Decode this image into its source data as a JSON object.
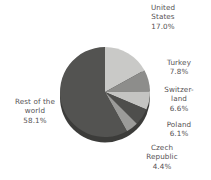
{
  "chart_data": {
    "type": "pie",
    "title": "",
    "subtitle": "",
    "xlabel": "",
    "ylabel": "",
    "legend_position": "none",
    "grid": false,
    "label_format": "name + percent",
    "start_angle_deg": 0,
    "direction": "clockwise",
    "categories": [
      "United States",
      "Turkey",
      "Switzerland",
      "Poland",
      "Czech Republic",
      "Rest of the world"
    ],
    "values": [
      17.0,
      7.8,
      6.6,
      6.1,
      4.4,
      58.1
    ],
    "units": "%",
    "slices": [
      {
        "name": "United States",
        "label_lines": "United\nStates\n17.0%",
        "value": 17.0,
        "percent_text": "17.0%",
        "color": "#c9c9c7"
      },
      {
        "name": "Turkey",
        "label_lines": "Turkey\n7.8%",
        "value": 7.8,
        "percent_text": "7.8%",
        "color": "#8d8d8b"
      },
      {
        "name": "Switzerland",
        "label_lines": "Switzer-\nland\n6.6%",
        "value": 6.6,
        "percent_text": "6.6%",
        "color": "#c4c4c2"
      },
      {
        "name": "Poland",
        "label_lines": "Poland\n6.1%",
        "value": 6.1,
        "percent_text": "6.1%",
        "color": "#4e4e4c"
      },
      {
        "name": "Czech Republic",
        "label_lines": "Czech\nRepublic\n4.4%",
        "value": 4.4,
        "percent_text": "4.4%",
        "color": "#9b9b99"
      },
      {
        "name": "Rest of the world",
        "label_lines": "Rest of the\nworld\n58.1%",
        "value": 58.1,
        "percent_text": "58.1%",
        "color": "#535351"
      }
    ],
    "colors": {
      "background": "#ffffff",
      "label_text": "#555153",
      "depth_shadow": "#3c3c3a"
    }
  }
}
